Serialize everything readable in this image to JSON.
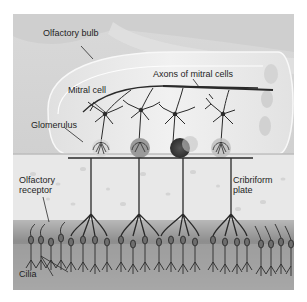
{
  "figure": {
    "labels": {
      "olfactory_bulb": "Olfactory bulb",
      "axons": "Axons of mitral cells",
      "mitral_cell": "Mitral cell",
      "glomerulus": "Glomerulus",
      "olfactory_receptor_line1": "Olfactory",
      "olfactory_receptor_line2": "receptor",
      "cribriform_line1": "Cribriform",
      "cribriform_line2": "plate",
      "cilia": "Cilia"
    },
    "colors": {
      "background_tissue": "#d4d4d4",
      "bulb_fill": "#ebebeb",
      "plate_fill": "#e6e6e6",
      "epithelium": "#8f8f8f",
      "neuron_stroke": "#2a2a2a",
      "glomerulus_dark": "#3a3a3a"
    }
  }
}
